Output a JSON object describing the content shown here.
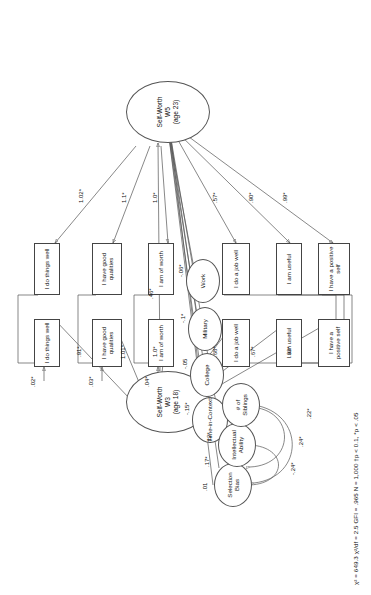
{
  "figure": {
    "type": "sem-path-diagram",
    "orientation": "rotated-90",
    "footer": "χ² = 649.3   χ²/df = 2.5   GFI = .965   N = 1,000   †p < 0.1, *p < .05"
  },
  "latent": {
    "w5": {
      "line1": "Self-Worth",
      "line2": "W5",
      "line3": "(age 23)"
    },
    "w3": {
      "line1": "Self-Worth",
      "line2": "W3",
      "line3": "(age 18)"
    }
  },
  "indicators_w5": {
    "top": [
      {
        "label": "I do things well",
        "loading": "1.02*"
      },
      {
        "label": "I have good qualities",
        "loading": "1.1*"
      },
      {
        "label": "I am of worth",
        "loading": "1.0*"
      }
    ],
    "bottom": [
      {
        "label": "I do a job well",
        "loading": ".57*"
      },
      {
        "label": "I am useful",
        "loading": ".90*"
      },
      {
        "label": "I have a positive self",
        "loading": ".99*"
      }
    ]
  },
  "indicators_w3": {
    "top": [
      {
        "label": "I do things well",
        "loading": ".91*",
        "error": ".02*"
      },
      {
        "label": "I have good qualities",
        "loading": "1.01*",
        "error": ".03*"
      },
      {
        "label": "I am of worth",
        "loading": "1.0*",
        "error": ".04*"
      }
    ],
    "bottom": [
      {
        "label": "I do a job well",
        "loading": ".68*"
      },
      {
        "label": "I am useful",
        "loading": ".67*"
      },
      {
        "label": "I have a positive self",
        "loading": ".93*"
      }
    ]
  },
  "context_predictors": [
    {
      "label": "Work",
      "coef": "-.06*"
    },
    {
      "label": "Military",
      "coef": "-.1*"
    },
    {
      "label": "College",
      "coef": "-.05"
    },
    {
      "label": "Time-in-Context",
      "coef": "-.15*"
    }
  ],
  "controls": [
    {
      "line1": "Selection",
      "line2": "Bias",
      "coef": ".01"
    },
    {
      "line1": "Intellectual",
      "line2": "Ability",
      "coef": ".17*"
    },
    {
      "line1": "# of",
      "line2": "Siblings",
      "coef": ".12*"
    }
  ],
  "control_correlations": [
    "-.24*",
    ".24*",
    ".22*"
  ],
  "structural_path": {
    "label": ".46*",
    "from": "Self-Worth W3",
    "to": "Self-Worth W5"
  }
}
